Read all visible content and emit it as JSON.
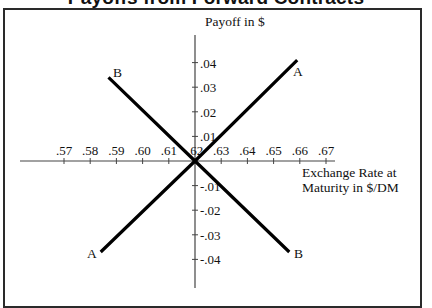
{
  "title": "Payoffs from Forward Contracts",
  "chart_data": {
    "type": "line",
    "title": "Payoffs from Forward Contracts",
    "xlabel": "Exchange Rate at Maturity in $/DM",
    "ylabel": "Payoff in $",
    "xlabel_lines": [
      "Exchange Rate at",
      "Maturity in $/DM"
    ],
    "x_ticks": [
      ".57",
      ".58",
      ".59",
      ".60",
      ".61",
      ".62",
      ".63",
      ".64",
      ".65",
      ".66",
      ".67"
    ],
    "x_tick_values": [
      0.57,
      0.58,
      0.59,
      0.6,
      0.61,
      0.62,
      0.63,
      0.64,
      0.65,
      0.66,
      0.67
    ],
    "y_ticks": [
      ".04",
      ".03",
      ".02",
      ".01",
      "-.01",
      "-.02",
      "-.03",
      "-.04"
    ],
    "y_tick_values": [
      0.04,
      0.03,
      0.02,
      0.01,
      -0.01,
      -0.02,
      -0.03,
      -0.04
    ],
    "origin": {
      "x": 0.62,
      "y": 0
    },
    "xlim": [
      0.565,
      0.675
    ],
    "ylim": [
      -0.045,
      0.045
    ],
    "grid": false,
    "legend": "none (lines labeled directly at endpoints)",
    "series": [
      {
        "name": "A",
        "description": "Long forward",
        "points": [
          {
            "x": 0.584,
            "y": -0.037
          },
          {
            "x": 0.62,
            "y": 0.0
          },
          {
            "x": 0.659,
            "y": 0.041
          }
        ]
      },
      {
        "name": "B",
        "description": "Short forward",
        "points": [
          {
            "x": 0.587,
            "y": 0.034
          },
          {
            "x": 0.62,
            "y": 0.0
          },
          {
            "x": 0.656,
            "y": -0.037
          }
        ]
      }
    ]
  },
  "labels": {
    "line_a_top": "A",
    "line_a_bottom": "A",
    "line_b_top": "B",
    "line_b_bottom": "B"
  }
}
